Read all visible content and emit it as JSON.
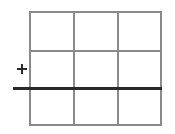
{
  "diagram": {
    "type": "grid",
    "rows": 3,
    "columns": 3,
    "grid_color": "#8a8a8a",
    "line_color": "#2a2a2a",
    "marker": {
      "symbol": "+",
      "position": "left of grid, in middle row"
    },
    "horizontal_line": {
      "position": "between middle and bottom rows",
      "extends_left_beyond_grid": true
    }
  }
}
